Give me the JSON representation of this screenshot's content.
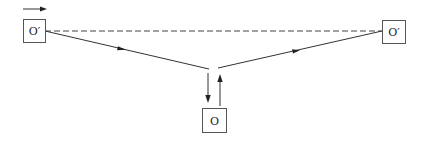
{
  "diagram": {
    "type": "ray-path",
    "nodes": [
      {
        "id": "left_source",
        "label": "O′"
      },
      {
        "id": "right_image",
        "label": "O′"
      },
      {
        "id": "bottom_observer",
        "label": "O"
      }
    ],
    "edges": [
      {
        "from": "left_source",
        "to": "right_image",
        "style": "dashed",
        "arrow": false
      },
      {
        "from": "left_source",
        "to": "apex",
        "style": "solid",
        "arrow": true
      },
      {
        "from": "apex",
        "to": "right_image",
        "style": "solid",
        "arrow": true
      },
      {
        "from": "apex",
        "to": "bottom_observer",
        "style": "solid",
        "arrow": true
      },
      {
        "from": "bottom_observer",
        "to": "apex",
        "style": "solid",
        "arrow": true
      }
    ],
    "motion_indicator": {
      "direction": "right",
      "description": "velocity arrow above left O′"
    }
  }
}
